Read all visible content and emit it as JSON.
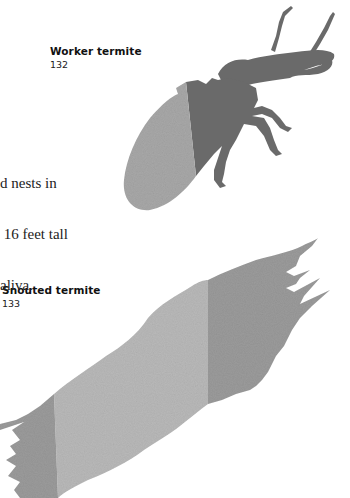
{
  "figures": [
    {
      "id": "worker",
      "label": "Worker termite",
      "number": "132",
      "colors": {
        "body_dark": "#6a6a6a",
        "abdomen_light": "#a8a8a8"
      }
    },
    {
      "id": "snouted",
      "label": "Snouted termite",
      "number": "133",
      "colors": {
        "band_dark": "#9b9b9b",
        "band_light": "#b9b9b9"
      }
    }
  ],
  "body_text": {
    "lines": [
      "d nests in",
      " 16 feet tall",
      "aliva."
    ]
  }
}
